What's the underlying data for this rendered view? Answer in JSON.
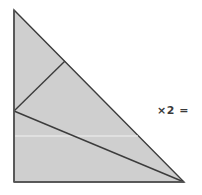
{
  "diagram": {
    "type": "geometric-dissection",
    "shape": "right-triangle",
    "fill_color": "#cfcfcf",
    "stroke_color": "#3c3c3c",
    "highlight_line_color": "#f2f2f2",
    "vertices": {
      "top": [
        14,
        10
      ],
      "bottom_left": [
        14,
        182
      ],
      "bottom_right": [
        184,
        182
      ],
      "hypotenuse_point": [
        65,
        61
      ],
      "left_edge_point": [
        14,
        111
      ]
    },
    "inner_segments": [
      {
        "from": "left_edge_point",
        "to": "hypotenuse_point"
      },
      {
        "from": "left_edge_point",
        "to": "bottom_right"
      }
    ],
    "white_line": {
      "y": 136,
      "x_start": 14,
      "x_end": 138
    }
  },
  "annotation": {
    "multiplier_text": "×2 ="
  }
}
